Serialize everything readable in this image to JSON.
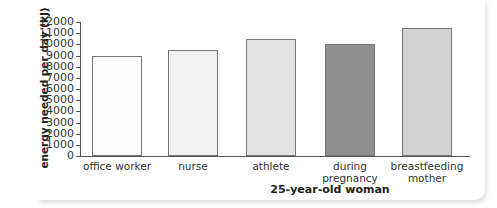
{
  "chart_data": {
    "type": "bar",
    "title": "",
    "xlabel": "25-year-old woman",
    "ylabel": "energy needed per day (kJ)",
    "ylim": [
      0,
      12000
    ],
    "yticks": [
      "0",
      "1000",
      "2000",
      "3000",
      "4000",
      "5000",
      "6000",
      "7000",
      "8000",
      "9000",
      "10000",
      "11000",
      "12000"
    ],
    "categories": [
      "office worker",
      "nurse",
      "athlete",
      "during pregnancy",
      "breastfeeding mother"
    ],
    "category_lines": [
      [
        "office worker"
      ],
      [
        "nurse"
      ],
      [
        "athlete"
      ],
      [
        "during",
        "pregnancy"
      ],
      [
        "breastfeeding",
        "mother"
      ]
    ],
    "values": [
      9000,
      9500,
      10500,
      10000,
      11500
    ],
    "colors": [
      "#fbfbfb",
      "#f1f1f1",
      "#e3e3e3",
      "#8f8f8f",
      "#d2d2d2"
    ],
    "grid": false,
    "legend": null
  }
}
